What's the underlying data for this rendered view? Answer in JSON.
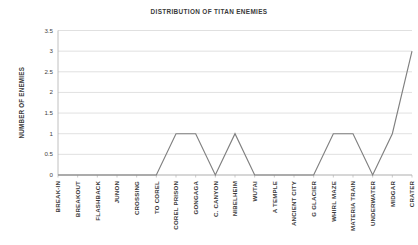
{
  "chart_data": {
    "type": "line",
    "title": "DISTRIBUTION OF TITAN ENEMIES",
    "xlabel": "",
    "ylabel": "NUMBER OF ENEMIES",
    "ylim": [
      0,
      3.5
    ],
    "yticks": [
      "0",
      "0.5",
      "1",
      "1.5",
      "2",
      "2.5",
      "3",
      "3.5"
    ],
    "ytick_values": [
      0,
      0.5,
      1,
      1.5,
      2,
      2.5,
      3,
      3.5
    ],
    "grid": true,
    "legend": "none",
    "series_color": "#808080",
    "categories": [
      "BREAK-IN",
      "BREAKOUT",
      "FLASHBACK",
      "JUNON",
      "CROSSING",
      "TO COREL",
      "COREL PRISON",
      "GONGAGA",
      "C. CANYON",
      "NIBELHEIM",
      "WUTAI",
      "A TEMPLE",
      "ANCIENT  CITY",
      "G GLACIER",
      "WHIRL  MAZE",
      "MATERIA TRAIN",
      "UNDERWATER",
      "MIDGAR",
      "CRATER"
    ],
    "values": [
      0,
      0,
      0,
      0,
      0,
      0,
      1,
      1,
      0,
      1,
      0,
      0,
      0,
      0,
      1,
      1,
      0,
      1,
      3
    ]
  }
}
